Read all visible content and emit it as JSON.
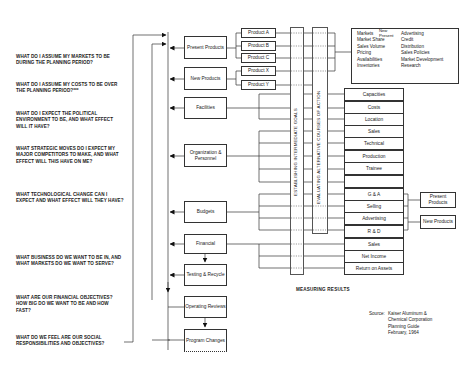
{
  "questions": [
    "What do I assume my markets to be during the planning period?",
    "What do I assume my costs to be over the planning period?***",
    "What do I expect the political environment to be, and what effect will it have?",
    "What strategic moves do I expect my major competitors to make, and what effect will this have on me?",
    "What technological change can I expect and what effect will they have?",
    "What business do we want to be in, and what markets do we want to serve?",
    "What are our financial objectives? How big do we want to be and how fast?",
    "What do we feel are our social responsibilities and objectives?"
  ],
  "main_boxes": [
    {
      "label": "Present Products"
    },
    {
      "label": "New Products"
    },
    {
      "label": "Facilities"
    },
    {
      "label": "Organization & Personnel"
    },
    {
      "label": "Budgets"
    },
    {
      "label": "Financial"
    },
    {
      "label": "Testing & Recycle"
    },
    {
      "label": "Operating Reviews"
    },
    {
      "label": "Program Changes"
    }
  ],
  "product_boxes": [
    "Product A",
    "Product B",
    "Product C",
    "Product X",
    "Product Y"
  ],
  "vertical_bands": {
    "band1": "Establishing Intermediate Goals",
    "band2": "Evaluating Alternative Courses of Action"
  },
  "market_box": {
    "col1": [
      "Markets",
      "Market Share",
      "Sales Volume",
      "Pricing",
      "Availabilities",
      "Inventories"
    ],
    "new_present": [
      "New",
      "Present"
    ],
    "col2": [
      "Advertising",
      "Credit",
      "Distribution",
      "Sales Policies",
      "Market Development",
      "Research"
    ]
  },
  "right_boxes": [
    "Capacities",
    "Costs",
    "Location",
    "Sales",
    "Technical",
    "Production",
    "Trainee",
    "",
    "G & A",
    "Selling",
    "Advertising",
    "R & D",
    "Sales",
    "Net Income",
    "Return on Assets"
  ],
  "side_boxes": [
    "Present Products",
    "New Products"
  ],
  "measuring_results": "MEASURING RESULTS",
  "source": {
    "label": "Source:",
    "lines": [
      "Kaiser Aluminum &",
      "Chemical Corporation",
      "Planning Guide",
      "February, 1964"
    ]
  }
}
